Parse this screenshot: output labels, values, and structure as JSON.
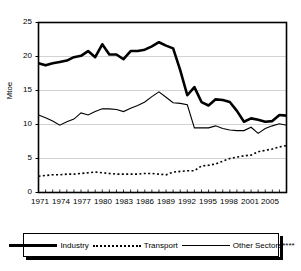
{
  "chart_data": {
    "type": "line",
    "title": "",
    "xlabel": "",
    "ylabel": "Mtoe",
    "ylim": [
      0,
      25
    ],
    "xlim": [
      1971,
      2006
    ],
    "yticks": [
      0,
      5,
      10,
      15,
      20,
      25
    ],
    "xticks": [
      1971,
      1974,
      1977,
      1980,
      1983,
      1986,
      1989,
      1992,
      1995,
      1998,
      2001,
      2005
    ],
    "grid": "horizontal",
    "legend_position": "bottom",
    "x": [
      1971,
      1972,
      1973,
      1974,
      1975,
      1976,
      1977,
      1978,
      1979,
      1980,
      1981,
      1982,
      1983,
      1984,
      1985,
      1986,
      1987,
      1988,
      1989,
      1990,
      1991,
      1992,
      1993,
      1994,
      1995,
      1996,
      1997,
      1998,
      1999,
      2000,
      2001,
      2002,
      2003,
      2004,
      2005,
      2006
    ],
    "series": [
      {
        "name": "Industry",
        "style": "thick-solid",
        "values": [
          19.0,
          18.7,
          19.0,
          19.2,
          19.4,
          19.9,
          20.1,
          20.8,
          19.9,
          21.8,
          20.3,
          20.3,
          19.6,
          20.8,
          20.8,
          21.0,
          21.5,
          22.1,
          21.6,
          21.2,
          18.0,
          14.3,
          15.5,
          13.3,
          12.8,
          13.7,
          13.6,
          13.3,
          12.0,
          10.4,
          10.9,
          10.7,
          10.4,
          10.5,
          11.4,
          11.3
        ]
      },
      {
        "name": "Transport",
        "style": "dotted",
        "values": [
          2.4,
          2.5,
          2.6,
          2.6,
          2.7,
          2.7,
          2.8,
          2.9,
          3.0,
          2.9,
          2.8,
          2.7,
          2.7,
          2.7,
          2.7,
          2.8,
          2.8,
          2.7,
          2.6,
          3.0,
          3.1,
          3.2,
          3.2,
          3.9,
          4.0,
          4.2,
          4.6,
          5.0,
          5.2,
          5.4,
          5.5,
          6.0,
          6.2,
          6.4,
          6.7,
          6.9
        ]
      },
      {
        "name": "Other Sectors****",
        "style": "thin-solid",
        "values": [
          11.4,
          11.0,
          10.5,
          9.9,
          10.4,
          10.8,
          11.7,
          11.4,
          11.9,
          12.3,
          12.3,
          12.2,
          11.9,
          12.4,
          12.8,
          13.3,
          14.1,
          14.8,
          14.0,
          13.2,
          13.1,
          12.9,
          9.5,
          9.5,
          9.5,
          9.8,
          9.4,
          9.2,
          9.1,
          9.1,
          9.6,
          8.7,
          9.4,
          9.8,
          10.1,
          9.9
        ]
      }
    ]
  },
  "yticklabels": [
    "25",
    "20",
    "15",
    "10",
    "5",
    "0"
  ],
  "xticklabels": [
    "1971",
    "1974",
    "1977",
    "1980",
    "1983",
    "1986",
    "1989",
    "1992",
    "1995",
    "1998",
    "2001",
    "2005"
  ],
  "axis": {
    "ylabel": "Mtoe"
  },
  "legend": {
    "items": [
      {
        "label": "Industry"
      },
      {
        "label": "Transport"
      },
      {
        "label": "Other Sectors****"
      }
    ]
  },
  "colors": {
    "line": "#000000",
    "grid": "#c8c8c8",
    "background": "#ffffff"
  }
}
